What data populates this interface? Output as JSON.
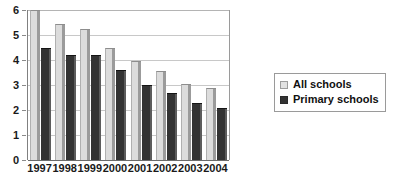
{
  "chart_data": {
    "type": "bar",
    "title": "",
    "xlabel": "",
    "ylabel": "",
    "categories": [
      "1997",
      "1998",
      "1999",
      "2000",
      "2001",
      "2002",
      "2003",
      "2004"
    ],
    "series": [
      {
        "name": "All schools",
        "color": "#dcdcdc",
        "values": [
          6.0,
          5.45,
          5.25,
          4.5,
          3.95,
          3.55,
          3.05,
          2.9
        ]
      },
      {
        "name": "Primary schools",
        "color": "#333333",
        "values": [
          4.5,
          4.2,
          4.2,
          3.6,
          3.0,
          2.7,
          2.3,
          2.1
        ]
      }
    ],
    "ylim": [
      0,
      6
    ],
    "y_ticks": [
      0,
      1,
      2,
      3,
      4,
      5,
      6
    ],
    "y_tick_labels": [
      "0",
      "1",
      "2",
      "3",
      "4",
      "5",
      "6"
    ],
    "grid": true,
    "legend_position": "right"
  },
  "legend": {
    "items": [
      {
        "label": "All schools",
        "swatch": "light-gray-square-icon"
      },
      {
        "label": "Primary schools",
        "swatch": "dark-gray-square-icon"
      }
    ]
  },
  "caption": {
    "text": ""
  }
}
